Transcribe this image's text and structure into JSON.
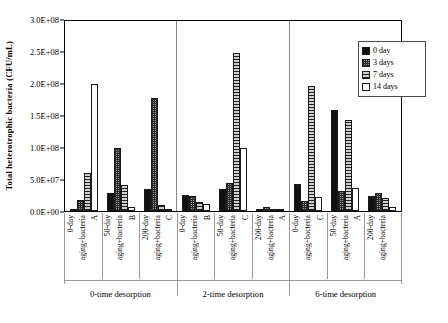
{
  "chart_data": {
    "type": "bar",
    "title": "",
    "xlabel": "",
    "ylabel": "Total heterotrophic bacteria (CFU/mL)",
    "ylim": [
      0,
      300000000
    ],
    "ytick_labels": [
      "3.0E+08",
      "2.5E+08",
      "2.0E+08",
      "1.5E+08",
      "1.0E+08",
      "5.0E+07",
      "0.0E+00"
    ],
    "ytick_values": [
      300000000,
      250000000,
      200000000,
      150000000,
      100000000,
      50000000,
      0
    ],
    "grid": false,
    "legend_position": "top-right",
    "legend": [
      "0 day",
      "3 days",
      "7 days",
      "14 days"
    ],
    "series": [
      {
        "name": "0 day",
        "values": [
          3000000,
          28000000,
          35000000,
          26000000,
          34000000,
          3000000,
          43000000,
          160000000,
          23000000
        ]
      },
      {
        "name": "3 days",
        "values": [
          17000000,
          99000000,
          178000000,
          24000000,
          44000000,
          6000000,
          16000000,
          31000000,
          29000000
        ]
      },
      {
        "name": "7 days",
        "values": [
          60000000,
          41000000,
          10000000,
          14000000,
          250000000,
          2000000,
          197000000,
          143000000,
          20000000
        ]
      },
      {
        "name": "14 days",
        "values": [
          200000000,
          7000000,
          3000000,
          11000000,
          100000000,
          2000000,
          22000000,
          36000000,
          7000000
        ]
      }
    ],
    "categories": [
      "0-day aging+bacteria",
      "50-day aging+bacteria",
      "200-day aging+bacteria",
      "0-day aging+bacteria",
      "50-day aging+bacteria",
      "200-day aging+bacteria",
      "0-day aging+bacteria",
      "50-day aging+bacteria",
      "200-day aging+bacteria"
    ],
    "category_letters": [
      "A",
      "B",
      "C",
      "B",
      "C",
      "A",
      "C",
      "A",
      ""
    ],
    "groups": [
      "0-time desorption",
      "2-time desorption",
      "6-time desorption"
    ],
    "group_size": 3
  },
  "axis": {
    "y_title": "Total heterotrophic bacteria (CFU/mL)",
    "ticks": [
      {
        "label": "3.0E+08"
      },
      {
        "label": "2.5E+08"
      },
      {
        "label": "2.0E+08"
      },
      {
        "label": "1.5E+08"
      },
      {
        "label": "1.0E+08"
      },
      {
        "label": "5.0E+07"
      },
      {
        "label": "0.0E+00"
      }
    ]
  },
  "legend": {
    "items": [
      {
        "label": "0 day",
        "pattern": "solid-black",
        "color": "#111111"
      },
      {
        "label": "3 days",
        "pattern": "cross-hatch",
        "color": "#9a9a9a"
      },
      {
        "label": "7 days",
        "pattern": "horizontal-lines",
        "color": "#cfcfcf"
      },
      {
        "label": "14 days",
        "pattern": "empty-white",
        "color": "#ffffff"
      }
    ]
  },
  "x_axis": {
    "groups": [
      {
        "label": "0-time desorption",
        "cells": [
          {
            "name": "0-day",
            "sub": "aging+bacteria",
            "letter": "A"
          },
          {
            "name": "50-day",
            "sub": "aging+bacteria",
            "letter": "B"
          },
          {
            "name": "200-day",
            "sub": "aging+bacteria",
            "letter": "C"
          }
        ]
      },
      {
        "label": "2-time desorption",
        "cells": [
          {
            "name": "0-day",
            "sub": "aging+bacteria",
            "letter": "B"
          },
          {
            "name": "50-day",
            "sub": "aging+bacteria",
            "letter": "C"
          },
          {
            "name": "200-day",
            "sub": "aging+bacteria",
            "letter": "A"
          }
        ]
      },
      {
        "label": "6-time desorption",
        "cells": [
          {
            "name": "0-day",
            "sub": "aging+bacteria",
            "letter": "C"
          },
          {
            "name": "50-day",
            "sub": "aging+bacteria",
            "letter": "A"
          },
          {
            "name": "200-day",
            "sub": "aging+bacteria",
            "letter": ""
          }
        ]
      }
    ]
  }
}
